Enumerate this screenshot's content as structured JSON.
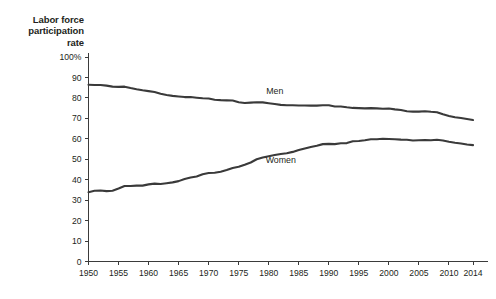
{
  "chart_data": {
    "type": "line",
    "title": "Labor force participation rate",
    "title_lines": [
      "Labor force",
      "participation",
      "rate"
    ],
    "xlabel": "",
    "ylabel": "Labor force participation rate",
    "xlim": [
      1950,
      2014
    ],
    "ylim": [
      0,
      100
    ],
    "grid": false,
    "legend_position": "inline-labels",
    "y_ticks": [
      0,
      10,
      20,
      30,
      40,
      50,
      60,
      70,
      80,
      90,
      100
    ],
    "y_tick_labels": [
      "0",
      "10",
      "20",
      "30",
      "40",
      "50",
      "60",
      "70",
      "80",
      "90",
      "100%"
    ],
    "x_ticks": [
      1950,
      1955,
      1960,
      1965,
      1970,
      1975,
      1980,
      1985,
      1990,
      1995,
      2000,
      2005,
      2010,
      2014
    ],
    "x_tick_labels": [
      "1950",
      "1955",
      "1960",
      "1965",
      "1970",
      "1975",
      "1980",
      "1985",
      "1990",
      "1995",
      "2000",
      "2005",
      "2010",
      "2014"
    ],
    "x": [
      1950,
      1951,
      1952,
      1953,
      1954,
      1955,
      1956,
      1957,
      1958,
      1959,
      1960,
      1961,
      1962,
      1963,
      1964,
      1965,
      1966,
      1967,
      1968,
      1969,
      1970,
      1971,
      1972,
      1973,
      1974,
      1975,
      1976,
      1977,
      1978,
      1979,
      1980,
      1981,
      1982,
      1983,
      1984,
      1985,
      1986,
      1987,
      1988,
      1989,
      1990,
      1991,
      1992,
      1993,
      1994,
      1995,
      1996,
      1997,
      1998,
      1999,
      2000,
      2001,
      2002,
      2003,
      2004,
      2005,
      2006,
      2007,
      2008,
      2009,
      2010,
      2011,
      2012,
      2013,
      2014
    ],
    "series": [
      {
        "name": "Men",
        "color": "#3a3a3a",
        "label_x": 1981,
        "label_y": 82,
        "values": [
          86.4,
          86.3,
          86.3,
          86.0,
          85.5,
          85.4,
          85.5,
          84.8,
          84.2,
          83.7,
          83.3,
          82.9,
          82.0,
          81.4,
          81.0,
          80.7,
          80.4,
          80.4,
          80.1,
          79.8,
          79.7,
          79.1,
          78.9,
          78.8,
          78.7,
          77.9,
          77.5,
          77.7,
          77.9,
          77.8,
          77.4,
          77.0,
          76.6,
          76.4,
          76.4,
          76.3,
          76.3,
          76.2,
          76.2,
          76.4,
          76.4,
          75.8,
          75.8,
          75.4,
          75.1,
          75.0,
          74.9,
          75.0,
          74.9,
          74.7,
          74.8,
          74.4,
          74.1,
          73.5,
          73.3,
          73.3,
          73.5,
          73.2,
          73.0,
          72.0,
          71.2,
          70.5,
          70.2,
          69.7,
          69.2
        ]
      },
      {
        "name": "Women",
        "color": "#3a3a3a",
        "label_x": 1982,
        "label_y": 48,
        "values": [
          33.9,
          34.6,
          34.7,
          34.4,
          34.6,
          35.7,
          36.9,
          36.9,
          37.1,
          37.1,
          37.7,
          38.1,
          37.9,
          38.3,
          38.7,
          39.3,
          40.3,
          41.1,
          41.6,
          42.7,
          43.3,
          43.4,
          43.9,
          44.7,
          45.7,
          46.3,
          47.3,
          48.4,
          50.0,
          50.9,
          51.5,
          52.1,
          52.6,
          52.9,
          53.6,
          54.5,
          55.3,
          56.0,
          56.6,
          57.4,
          57.5,
          57.4,
          57.8,
          57.9,
          58.8,
          58.9,
          59.3,
          59.8,
          59.8,
          60.0,
          59.9,
          59.8,
          59.6,
          59.5,
          59.2,
          59.3,
          59.4,
          59.3,
          59.5,
          59.2,
          58.6,
          58.1,
          57.7,
          57.2,
          56.9
        ]
      }
    ]
  }
}
